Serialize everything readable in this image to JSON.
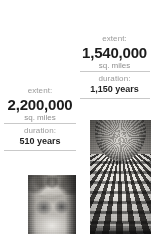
{
  "infographic": {
    "left_column": {
      "extent_label": "extent:",
      "extent_value": "2,200,000",
      "extent_units": "sq. miles",
      "duration_label": "duration:",
      "duration_value": "510 years",
      "photo_caption": "marble-sculpture-head"
    },
    "right_column": {
      "extent_label": "extent:",
      "extent_value": "1,540,000",
      "extent_units": "sq. miles",
      "duration_label": "duration:",
      "duration_value": "1,150 years",
      "photo_caption": "coffered-dome-interior"
    }
  },
  "colors": {
    "background": "#ffffff",
    "muted_text": "#9a9a9a",
    "strong_text": "#1c1c1c",
    "divider": "#c9c9c9"
  }
}
